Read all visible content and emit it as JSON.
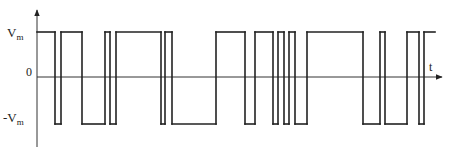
{
  "diagram": {
    "type": "pulse-waveform",
    "y_axis_labels": {
      "high": "V",
      "high_sub": "m",
      "zero": "0",
      "low": "-V",
      "low_sub": "m"
    },
    "x_axis_label": "t",
    "levels": {
      "high": 1,
      "zero": 0,
      "low": -1
    },
    "colors": {
      "stroke": "#222222",
      "axis": "#333333"
    },
    "waveform": {
      "description": "Bipolar pulse train switching between +Vm and -Vm; transition times in arbitrary units along t",
      "start_level": 1,
      "transitions": [
        {
          "t": 18,
          "to": -1
        },
        {
          "t": 24,
          "to": 1
        },
        {
          "t": 45,
          "to": -1
        },
        {
          "t": 68,
          "to": 1
        },
        {
          "t": 73,
          "to": -1
        },
        {
          "t": 79,
          "to": 1
        },
        {
          "t": 124,
          "to": -1
        },
        {
          "t": 128,
          "to": 1
        },
        {
          "t": 135,
          "to": -1
        },
        {
          "t": 179,
          "to": 1
        },
        {
          "t": 208,
          "to": -1
        },
        {
          "t": 218,
          "to": 1
        },
        {
          "t": 236,
          "to": -1
        },
        {
          "t": 241,
          "to": 1
        },
        {
          "t": 247,
          "to": -1
        },
        {
          "t": 252,
          "to": 1
        },
        {
          "t": 258,
          "to": -1
        },
        {
          "t": 270,
          "to": 1
        },
        {
          "t": 326,
          "to": -1
        },
        {
          "t": 343,
          "to": 1
        },
        {
          "t": 348,
          "to": -1
        },
        {
          "t": 370,
          "to": 1
        },
        {
          "t": 382,
          "to": -1
        },
        {
          "t": 387,
          "to": 1
        }
      ],
      "end_t": 398
    }
  }
}
